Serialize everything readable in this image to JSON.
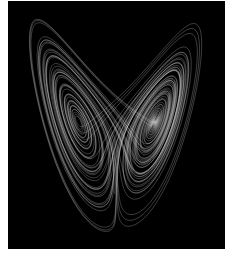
{
  "image": {
    "subject": "Lorenz attractor",
    "background_color": "#000000",
    "page_color": "#ffffff",
    "curve_color": "#e8e8e8"
  },
  "attractor": {
    "sigma": 10,
    "rho": 28,
    "beta": 2.6667,
    "steps": 14000,
    "dt": 0.006,
    "x_range": [
      -22,
      22
    ],
    "z_range": [
      2,
      50
    ]
  }
}
